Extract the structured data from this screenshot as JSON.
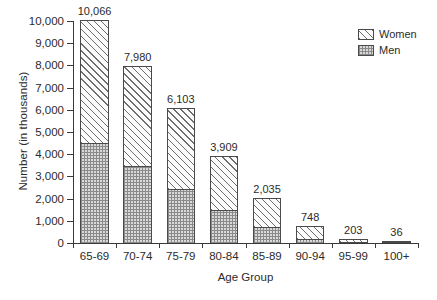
{
  "chart_data": {
    "type": "bar",
    "subtype": "stacked-vertical",
    "title": "",
    "xlabel": "Age Group",
    "ylabel": "Number (in thousands)",
    "categories": [
      "65-69",
      "70-74",
      "75-79",
      "80-84",
      "85-89",
      "90-94",
      "95-99",
      "100+"
    ],
    "series": [
      {
        "name": "Men",
        "values": [
          4505,
          3470,
          2430,
          1490,
          730,
          180,
          45,
          7
        ]
      },
      {
        "name": "Women",
        "values": [
          5561,
          4510,
          3673,
          2419,
          1305,
          568,
          158,
          29
        ]
      }
    ],
    "totals": [
      10066,
      7980,
      6103,
      3909,
      2035,
      748,
      203,
      36
    ],
    "total_labels": [
      "10,066",
      "7,980",
      "6,103",
      "3,909",
      "2,035",
      "748",
      "203",
      "36"
    ],
    "ylim": [
      0,
      10000
    ],
    "ytick_values": [
      0,
      1000,
      2000,
      3000,
      4000,
      5000,
      6000,
      7000,
      8000,
      9000,
      10000
    ],
    "ytick_labels": [
      "0",
      "1,000",
      "2,000",
      "3,000",
      "4,000",
      "5,000",
      "6,000",
      "7,000",
      "8,000",
      "9,000",
      "10,000"
    ],
    "grid": false,
    "legend_position": "top-right",
    "legend": [
      {
        "label": "Women",
        "pattern": "diagonal-hatch"
      },
      {
        "label": "Men",
        "pattern": "checkered"
      }
    ],
    "colors": {
      "axis": "#3a3a3a",
      "bar_outline": "#4a4a4a",
      "women_fill": "#fbfbfb",
      "women_hatch": "#6e6e6e",
      "men_fill": "#d9d9d9",
      "men_hatch": "#8a8a8a",
      "text": "#2b2b2b",
      "background": "#ffffff"
    }
  }
}
